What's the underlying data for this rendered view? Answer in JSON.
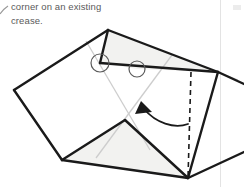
{
  "panel": {
    "instruction_text": "corner on an existing\ncrease.",
    "text_color": "#5a5a5a",
    "background_color": "#ffffff",
    "divider_color": "#e3e3e3"
  },
  "diagram": {
    "name": "origami-fold-step",
    "title": "",
    "stroke_color": "#1a1a1a",
    "crease_color": "#c9c9c9",
    "fill_color": "#f2f2f0",
    "paper_fill": "#ffffff",
    "outline_points": "108,30 218,72 188,178 62,160 14,90",
    "shaded_upper": "108,30 218,72 137,69 100,63",
    "shaded_lower": "125,120 188,178 62,160",
    "edge_top_left": "14,90 108,30",
    "edge_top_right": "108,30 218,72",
    "edge_right": "218,72 188,178",
    "edge_bottom": "188,178 62,160",
    "edge_left": "62,160 14,90",
    "fold_edge": "100,63 218,72",
    "fold_edge_2": "108,30 100,63",
    "valley_left": "62,160 125,120",
    "valley_right": "125,120 188,178",
    "crease_a": "86,41 150,150",
    "crease_b": "172,55 96,158",
    "crease_c": "218,72 232,76",
    "dashed_line": "191,72 188,178",
    "dashed_pattern": "5,4",
    "circle_1": {
      "cx": 100,
      "cy": 63,
      "r": 9
    },
    "circle_2": {
      "cx": 137,
      "cy": 69,
      "r": 8
    },
    "arrow_path": "M 186,123 C 172,127 155,122 143,108",
    "arrow_head": "143,103 136,112 150,113",
    "off_edge_right_1": "218,72 244,84",
    "off_edge_right_2": "188,178 244,150"
  }
}
